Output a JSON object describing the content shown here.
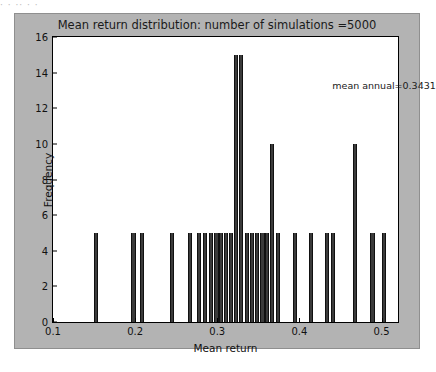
{
  "top_strip_text": "·   ·    ·· ·   ·",
  "figure": {
    "facecolor": "#b3b3b3",
    "axes_facecolor": "#ffffff",
    "bar_color": "#3b3b3b"
  },
  "annotation": {
    "text": "mean annual=0.3431",
    "x": 0.44,
    "y": 13.6
  },
  "chart_data": {
    "type": "bar",
    "title": "Mean return distribution: number of simulations =5000",
    "xlabel": "Mean return",
    "ylabel": "Frequency",
    "xlim": [
      0.1,
      0.52
    ],
    "ylim": [
      0,
      16
    ],
    "xticks": [
      0.1,
      0.2,
      0.3,
      0.4,
      0.5
    ],
    "xticklabels": [
      "0.1",
      "0.2",
      "0.3",
      "0.4",
      "0.5"
    ],
    "yticks": [
      0,
      2,
      4,
      6,
      8,
      10,
      12,
      14,
      16
    ],
    "yticklabels": [
      "0",
      "2",
      "4",
      "6",
      "8",
      "10",
      "12",
      "14",
      "16"
    ],
    "grid": false,
    "legend": null,
    "bar_width": 0.005,
    "x": [
      0.152,
      0.198,
      0.208,
      0.245,
      0.267,
      0.278,
      0.285,
      0.292,
      0.299,
      0.305,
      0.311,
      0.317,
      0.323,
      0.329,
      0.336,
      0.342,
      0.348,
      0.355,
      0.361,
      0.367,
      0.374,
      0.395,
      0.414,
      0.434,
      0.441,
      0.468,
      0.489,
      0.503
    ],
    "values": [
      5,
      5,
      5,
      5,
      5,
      5,
      5,
      5,
      5,
      5,
      5,
      5,
      15,
      15,
      5,
      5,
      5,
      5,
      5,
      10,
      5,
      5,
      5,
      5,
      5,
      10,
      5,
      5
    ]
  }
}
